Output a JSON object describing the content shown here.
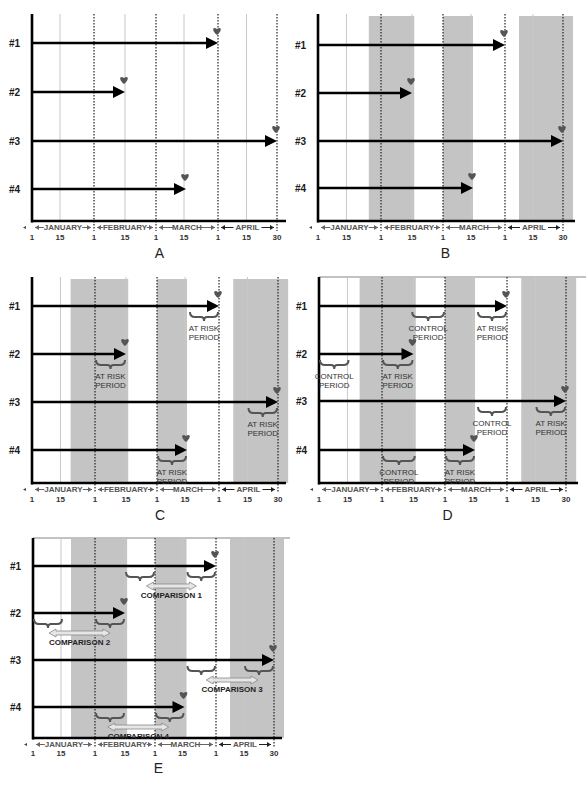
{
  "figure": {
    "colors": {
      "axis": "#000000",
      "arrow": "#000000",
      "band": "#c4c4c4",
      "gridline": "#c8c8c8",
      "dotted": "#222222",
      "heart": "#555555",
      "braces": "#555555",
      "comparison_arrow_fill": "#e6e6e6",
      "comparison_arrow_stroke": "#888888"
    }
  },
  "axis": {
    "months": [
      "JANUARY",
      "FEBRUARY",
      "MARCH",
      "APRIL"
    ],
    "ticks": [
      "1",
      "15",
      "1",
      "15",
      "1",
      "15",
      "1",
      "15",
      "30"
    ],
    "tick_days": [
      0,
      14,
      31,
      45,
      59,
      73,
      90,
      104,
      119
    ]
  },
  "rows": [
    "#1",
    "#2",
    "#3",
    "#4"
  ],
  "panels": [
    {
      "id": "A",
      "letter": "A",
      "frame": {
        "x0": 32,
        "top": 14,
        "axisY": 221,
        "xEnd": 286,
        "dFeb": 94,
        "dMar": 156,
        "dApr": 218,
        "dEnd": 277,
        "rowY": [
          43,
          92,
          141,
          189
        ],
        "tickY": 240,
        "monthY": 230,
        "letterY": 258
      },
      "bands": [],
      "topLine": false,
      "arrows": [
        {
          "row": 0,
          "end_day": 90
        },
        {
          "row": 1,
          "end_day": 45
        },
        {
          "row": 2,
          "end_day": 119
        },
        {
          "row": 3,
          "end_day": 74
        }
      ],
      "periods": [],
      "comparisons": []
    },
    {
      "id": "B",
      "letter": "B",
      "frame": {
        "x0": 318,
        "top": 14,
        "axisY": 221,
        "xEnd": 575,
        "dFeb": 381,
        "dMar": 443,
        "dApr": 505,
        "dEnd": 563,
        "rowY": [
          45,
          93,
          141,
          188
        ],
        "tickY": 240,
        "monthY": 230,
        "letterY": 258
      },
      "bands": [
        {
          "start_day": 25,
          "end_day": 46
        },
        {
          "start_day": 59,
          "end_day": 74
        },
        {
          "start_day": 97,
          "end_day": 124
        }
      ],
      "topLine": false,
      "arrows": [
        {
          "row": 0,
          "end_day": 90
        },
        {
          "row": 1,
          "end_day": 45
        },
        {
          "row": 2,
          "end_day": 119
        },
        {
          "row": 3,
          "end_day": 74
        }
      ],
      "periods": [],
      "comparisons": []
    },
    {
      "id": "C",
      "letter": "C",
      "frame": {
        "x0": 32,
        "top": 277,
        "axisY": 483,
        "xEnd": 286,
        "dFeb": 95,
        "dMar": 157,
        "dApr": 219,
        "dEnd": 278,
        "rowY": [
          306,
          354,
          402,
          450
        ],
        "tickY": 502,
        "monthY": 492,
        "letterY": 520
      },
      "bands": [
        {
          "start_day": 19,
          "end_day": 46
        },
        {
          "start_day": 59,
          "end_day": 74
        },
        {
          "start_day": 97,
          "end_day": 124
        }
      ],
      "topLine": false,
      "arrows": [
        {
          "row": 0,
          "end_day": 90
        },
        {
          "row": 1,
          "end_day": 45
        },
        {
          "row": 2,
          "end_day": 119
        },
        {
          "row": 3,
          "end_day": 74
        }
      ],
      "periods": [
        {
          "row": 0,
          "start_day": 75,
          "end_day": 90,
          "label1": "AT RISK",
          "label2": "PERIOD"
        },
        {
          "row": 1,
          "start_day": 31,
          "end_day": 45,
          "label1": "AT RISK",
          "label2": "PERIOD"
        },
        {
          "row": 2,
          "start_day": 104,
          "end_day": 119,
          "label1": "AT RISK",
          "label2": "PERIOD"
        },
        {
          "row": 3,
          "start_day": 59,
          "end_day": 74,
          "label1": "AT RISK",
          "label2": "PERIOD"
        }
      ],
      "comparisons": []
    },
    {
      "id": "D",
      "letter": "D",
      "frame": {
        "x0": 319,
        "top": 277,
        "axisY": 483,
        "xEnd": 578,
        "dFeb": 382,
        "dMar": 445,
        "dApr": 507,
        "dEnd": 566,
        "rowY": [
          306,
          354,
          401,
          450
        ],
        "tickY": 502,
        "monthY": 492,
        "letterY": 520
      },
      "bands": [
        {
          "start_day": 20,
          "end_day": 46
        },
        {
          "start_day": 59,
          "end_day": 74
        },
        {
          "start_day": 97,
          "end_day": 124
        }
      ],
      "topLine": true,
      "arrows": [
        {
          "row": 0,
          "end_day": 90
        },
        {
          "row": 1,
          "end_day": 45
        },
        {
          "row": 2,
          "end_day": 119
        },
        {
          "row": 3,
          "end_day": 74
        }
      ],
      "periods": [
        {
          "row": 0,
          "start_day": 44,
          "end_day": 59,
          "label1": "CONTROL",
          "label2": "PERIOD"
        },
        {
          "row": 0,
          "start_day": 75,
          "end_day": 90,
          "label1": "AT RISK",
          "label2": "PERIOD"
        },
        {
          "row": 1,
          "start_day": 0,
          "end_day": 15,
          "label1": "CONTROL",
          "label2": "PERIOD"
        },
        {
          "row": 1,
          "start_day": 31,
          "end_day": 45,
          "label1": "AT RISK",
          "label2": "PERIOD"
        },
        {
          "row": 2,
          "start_day": 75,
          "end_day": 90,
          "label1": "CONTROL",
          "label2": "PERIOD"
        },
        {
          "row": 2,
          "start_day": 104,
          "end_day": 119,
          "label1": "AT RISK",
          "label2": "PERIOD"
        },
        {
          "row": 3,
          "start_day": 31,
          "end_day": 46,
          "label1": "CONTROL",
          "label2": "PERIOD"
        },
        {
          "row": 3,
          "start_day": 59,
          "end_day": 74,
          "label1": "AT RISK",
          "label2": "PERIOD"
        }
      ],
      "comparisons": []
    },
    {
      "id": "E",
      "letter": "E",
      "frame": {
        "x0": 33,
        "top": 538,
        "axisY": 738,
        "xEnd": 282,
        "dFeb": 95,
        "dMar": 155,
        "dApr": 216,
        "dEnd": 274,
        "rowY": [
          566,
          613,
          660,
          707
        ],
        "tickY": 756,
        "monthY": 747,
        "letterY": 773
      },
      "bands": [
        {
          "start_day": 19,
          "end_day": 46
        },
        {
          "start_day": 59,
          "end_day": 75
        },
        {
          "start_day": 97,
          "end_day": 124
        }
      ],
      "topLine": true,
      "arrows": [
        {
          "row": 0,
          "end_day": 90
        },
        {
          "row": 1,
          "end_day": 45
        },
        {
          "row": 2,
          "end_day": 119
        },
        {
          "row": 3,
          "end_day": 74
        }
      ],
      "periods": [
        {
          "row": 0,
          "start_day": 45,
          "end_day": 59
        },
        {
          "row": 0,
          "start_day": 75,
          "end_day": 90
        },
        {
          "row": 1,
          "start_day": 0,
          "end_day": 15
        },
        {
          "row": 1,
          "start_day": 31,
          "end_day": 45
        },
        {
          "row": 2,
          "start_day": 75,
          "end_day": 90
        },
        {
          "row": 2,
          "start_day": 104,
          "end_day": 119
        },
        {
          "row": 3,
          "start_day": 31,
          "end_day": 45
        },
        {
          "row": 3,
          "start_day": 59,
          "end_day": 74
        }
      ],
      "comparisons": [
        {
          "row": 0,
          "from_day": 55,
          "to_day": 80,
          "label": "COMPARISON 1"
        },
        {
          "row": 1,
          "from_day": 8,
          "to_day": 38,
          "label": "COMPARISON 2"
        },
        {
          "row": 2,
          "from_day": 85,
          "to_day": 111,
          "label": "COMPARISON 3"
        },
        {
          "row": 3,
          "from_day": 37,
          "to_day": 66,
          "label": "COMPARISON 4"
        }
      ]
    }
  ]
}
